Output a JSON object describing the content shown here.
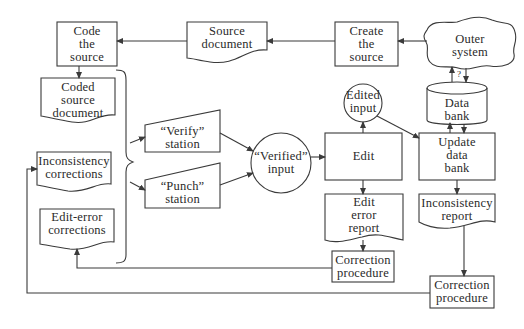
{
  "diagram": {
    "type": "flowchart",
    "colors": {
      "stroke": "#3a3a3a",
      "text": "#2a2a2a",
      "background": "#ffffff"
    },
    "nodes": {
      "code_source": {
        "label": "Code\nthe\nsource",
        "shape": "process"
      },
      "source_document": {
        "label": "Source\ndocument",
        "shape": "document"
      },
      "create_source": {
        "label": "Create\nthe\nsource",
        "shape": "process"
      },
      "outer_system": {
        "label": "Outer\nsystem",
        "shape": "cloud"
      },
      "coded_source_document": {
        "label": "Coded\nsource\ndocument",
        "shape": "document"
      },
      "inconsistency_corrections": {
        "label": "Inconsistency\ncorrections",
        "shape": "document"
      },
      "edit_error_corrections": {
        "label": "Edit-error\ncorrections",
        "shape": "document"
      },
      "verify_station": {
        "label": "“Verify”\nstation",
        "shape": "manual-input"
      },
      "punch_station": {
        "label": "“Punch”\nstation",
        "shape": "manual-input"
      },
      "verified_input": {
        "label": "“Verified”\ninput",
        "shape": "circle"
      },
      "edited_input": {
        "label": "Edited\ninput",
        "shape": "circle"
      },
      "edit": {
        "label": "Edit",
        "shape": "process"
      },
      "edit_error_report": {
        "label": "Edit\nerror\nreport",
        "shape": "document"
      },
      "correction_procedure_1": {
        "label": "Correction\nprocedure",
        "shape": "process"
      },
      "data_bank": {
        "label": "Data\nbank",
        "shape": "cylinder"
      },
      "update_data_bank": {
        "label": "Update\ndata\nbank",
        "shape": "process"
      },
      "inconsistency_report": {
        "label": "Inconsistency\nreport",
        "shape": "document"
      },
      "correction_procedure_2": {
        "label": "Correction\nprocedure",
        "shape": "process"
      }
    },
    "annotations": {
      "query_mark": "?"
    },
    "edges": [
      [
        "outer_system",
        "create_source"
      ],
      [
        "create_source",
        "source_document"
      ],
      [
        "source_document",
        "code_source"
      ],
      [
        "code_source",
        "coded_source_document"
      ],
      [
        "bracket_group",
        "verify_station"
      ],
      [
        "bracket_group",
        "punch_station"
      ],
      [
        "verify_station",
        "verified_input"
      ],
      [
        "punch_station",
        "verified_input"
      ],
      [
        "verified_input",
        "edit"
      ],
      [
        "edit",
        "edited_input"
      ],
      [
        "edit",
        "edit_error_report"
      ],
      [
        "edited_input",
        "update_data_bank"
      ],
      [
        "edit_error_report",
        "correction_procedure_1"
      ],
      [
        "correction_procedure_1",
        "edit_error_corrections"
      ],
      [
        "outer_system",
        "data_bank"
      ],
      [
        "data_bank",
        "outer_system"
      ],
      [
        "data_bank",
        "update_data_bank"
      ],
      [
        "update_data_bank",
        "data_bank"
      ],
      [
        "update_data_bank",
        "inconsistency_report"
      ],
      [
        "inconsistency_report",
        "correction_procedure_2"
      ],
      [
        "correction_procedure_2",
        "inconsistency_corrections"
      ]
    ]
  }
}
